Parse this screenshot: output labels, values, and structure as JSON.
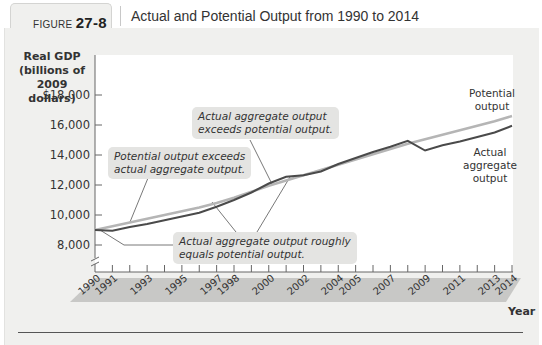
{
  "figure": {
    "label_prefix": "FIGURE",
    "label_number": "27-8",
    "title": "Actual and Potential Output from 1990 to 2014"
  },
  "chart_data": {
    "type": "line",
    "title": "Actual and Potential Output from 1990 to 2014",
    "ylabel": "Real GDP (billions of 2009 dollars)",
    "xlabel": "Year",
    "ylim": [
      7000,
      18000
    ],
    "y_ticks": [
      "$18,000",
      "16,000",
      "14,000",
      "12,000",
      "10,000",
      "8,000"
    ],
    "x_ticks": [
      "1990",
      "1991",
      "1993",
      "1995",
      "1997",
      "1998",
      "2000",
      "2002",
      "2004",
      "2005",
      "2007",
      "2009",
      "2011",
      "2013",
      "2014"
    ],
    "x": [
      1990,
      1991,
      1992,
      1993,
      1994,
      1995,
      1996,
      1997,
      1998,
      1999,
      2000,
      2001,
      2002,
      2003,
      2004,
      2005,
      2006,
      2007,
      2008,
      2009,
      2010,
      2011,
      2012,
      2013,
      2014
    ],
    "series": [
      {
        "name": "Potential output",
        "color": "#b5b5b5",
        "values": [
          9000,
          9250,
          9500,
          9750,
          10000,
          10250,
          10500,
          10800,
          11150,
          11550,
          11950,
          12300,
          12650,
          13000,
          13350,
          13700,
          14050,
          14400,
          14750,
          15050,
          15350,
          15650,
          15950,
          16250,
          16600
        ]
      },
      {
        "name": "Actual aggregate output",
        "color": "#4a4a4a",
        "values": [
          9000,
          8950,
          9200,
          9400,
          9650,
          9900,
          10150,
          10550,
          11000,
          11500,
          12100,
          12550,
          12650,
          12900,
          13400,
          13800,
          14200,
          14550,
          14950,
          14300,
          14650,
          14900,
          15200,
          15500,
          15950
        ]
      }
    ],
    "annotations": [
      "Potential output exceeds actual aggregate output.",
      "Actual aggregate output exceeds potential output.",
      "Actual aggregate output roughly equals potential output."
    ],
    "grid": false
  },
  "axis": {
    "ylabel_lines": [
      "Real GDP",
      "(billions of",
      "2009 dollars)"
    ],
    "yticks": [
      {
        "label": "$18,000",
        "y": 95
      },
      {
        "label": "16,000",
        "y": 125
      },
      {
        "label": "14,000",
        "y": 155
      },
      {
        "label": "12,000",
        "y": 185
      },
      {
        "label": "10,000",
        "y": 215
      },
      {
        "label": "8,000",
        "y": 245
      }
    ],
    "xlabel": "Year"
  },
  "labels": {
    "potential_line1": "Potential",
    "potential_line2": "output",
    "actual_line1": "Actual",
    "actual_line2": "aggregate",
    "actual_line3": "output"
  },
  "bubbles": {
    "b1_line1": "Potential output exceeds",
    "b1_line2": "actual aggregate output.",
    "b2_line1": "Actual aggregate output",
    "b2_line2": "exceeds potential output.",
    "b3_line1": "Actual aggregate output roughly",
    "b3_line2": "equals potential output."
  },
  "xticklabels": [
    "1990",
    "1991",
    "1993",
    "1995",
    "1997",
    "1998",
    "2000",
    "2002",
    "2004",
    "2005",
    "2007",
    "2009",
    "2011",
    "2013",
    "2014"
  ]
}
